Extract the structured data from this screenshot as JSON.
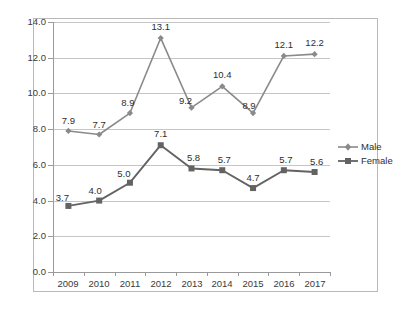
{
  "chart_data": {
    "type": "line",
    "title": "",
    "subtitle": "",
    "xlabel": "",
    "ylabel": "",
    "categories": [
      "2009",
      "2010",
      "2011",
      "2012",
      "2013",
      "2014",
      "2015",
      "2016",
      "2017"
    ],
    "series": [
      {
        "name": "Male",
        "marker": "diamond",
        "color": "#8a8a8a",
        "values": [
          7.9,
          7.7,
          8.9,
          13.1,
          9.2,
          10.4,
          8.9,
          12.1,
          12.2
        ],
        "labels": [
          "7.9",
          "7.7",
          "8.9",
          "13.1",
          "9.2",
          "10.4",
          "8.9",
          "12.1",
          "12.2"
        ]
      },
      {
        "name": "Female",
        "marker": "square",
        "color": "#636363",
        "values": [
          3.7,
          4.0,
          5.0,
          7.1,
          5.8,
          5.7,
          4.7,
          5.7,
          5.6
        ],
        "labels": [
          "3.7",
          "4.0",
          "5.0",
          "7.1",
          "5.8",
          "5.7",
          "4.7",
          "5.7",
          "5.6"
        ]
      }
    ],
    "ylim": [
      0.0,
      14.0
    ],
    "ytick_step": 2.0,
    "ytick_labels": [
      "14.0",
      "12.0",
      "10.0",
      "8.0",
      "6.0",
      "4.0",
      "2.0",
      "0.0"
    ],
    "ytick_values": [
      14.0,
      12.0,
      10.0,
      8.0,
      6.0,
      4.0,
      2.0,
      0.0
    ],
    "grid": true,
    "grid_axis": "y",
    "legend_position": "right",
    "legend_entries": [
      "Male",
      "Female"
    ],
    "data_labels_shown": true
  },
  "colors": {
    "male_line": "#8a8a8a",
    "female_line": "#636363",
    "gridline": "#c6c6c6",
    "axis": "#9a9a9a",
    "frame_border": "#b9b9b9",
    "text": "#2e2e2e",
    "background": "#ffffff"
  }
}
